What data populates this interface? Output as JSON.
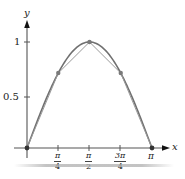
{
  "chart_data": {
    "type": "line",
    "title": "",
    "xlabel": "x",
    "ylabel": "y",
    "xlim": [
      0,
      3.1416
    ],
    "ylim": [
      0,
      1.1
    ],
    "grid": false,
    "x_ticks": [
      {
        "value": 0.7854,
        "num": "π",
        "den": "4"
      },
      {
        "value": 1.5708,
        "num": "π",
        "den": "2"
      },
      {
        "value": 2.3562,
        "num": "3π",
        "den": "4"
      },
      {
        "value": 3.1416,
        "label": "π"
      }
    ],
    "y_ticks": [
      {
        "value": 0.5,
        "label": "0.5"
      },
      {
        "value": 1,
        "label": "1"
      }
    ],
    "series": [
      {
        "name": "y = sin x",
        "kind": "curve",
        "function": "sin(x)",
        "color": "#707070"
      },
      {
        "name": "polygonal approximation",
        "kind": "polyline",
        "color": "#9a9a9a",
        "x": [
          0,
          0.7854,
          1.5708,
          2.3562,
          3.1416
        ],
        "values": [
          0,
          0.7071,
          1,
          0.7071,
          0
        ]
      }
    ],
    "points": [
      {
        "x": 0,
        "y": 0
      },
      {
        "x": 0.7854,
        "y": 0.7071
      },
      {
        "x": 1.5708,
        "y": 1
      },
      {
        "x": 2.3562,
        "y": 0.7071
      },
      {
        "x": 3.1416,
        "y": 0
      }
    ]
  },
  "labels": {
    "y_axis": "y",
    "x_axis": "x",
    "y_one": "1",
    "y_half": "0.5",
    "pi": "π",
    "pi_over_4_num": "π",
    "pi_over_4_den": "4",
    "pi_over_2_num": "π",
    "pi_over_2_den": "2",
    "three_pi_over_4_num": "3π",
    "three_pi_over_4_den": "4"
  },
  "colors": {
    "axis": "#555555",
    "curve": "#707070",
    "polyline": "#9a9a9a",
    "point": "#7a7a7a"
  }
}
